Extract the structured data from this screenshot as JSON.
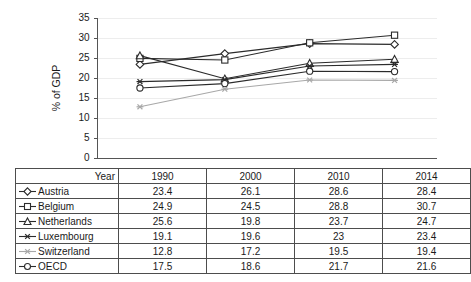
{
  "chart_data": {
    "type": "line",
    "title": "",
    "xlabel": "",
    "ylabel": "% of GDP",
    "categories": [
      "1990",
      "2000",
      "2010",
      "2014"
    ],
    "ylim": [
      0,
      35
    ],
    "yticks": [
      0,
      5,
      10,
      15,
      20,
      25,
      30,
      35
    ],
    "grid": true,
    "legend_position": "table",
    "series": [
      {
        "name": "Austria",
        "marker": "diamond",
        "color": "#2b2b2b",
        "values": [
          23.4,
          26.1,
          28.6,
          28.4
        ]
      },
      {
        "name": "Belgium",
        "marker": "square",
        "color": "#2b2b2b",
        "values": [
          24.9,
          24.5,
          28.8,
          30.7
        ]
      },
      {
        "name": "Netherlands",
        "marker": "triangle",
        "color": "#2b2b2b",
        "values": [
          25.6,
          19.8,
          23.7,
          24.7
        ]
      },
      {
        "name": "Luxembourg",
        "marker": "asterisk",
        "color": "#2b2b2b",
        "values": [
          19.1,
          19.6,
          23.0,
          23.4
        ]
      },
      {
        "name": "Switzerland",
        "marker": "asterisk",
        "color": "#a8a8a8",
        "values": [
          12.8,
          17.2,
          19.5,
          19.4
        ]
      },
      {
        "name": "OECD",
        "marker": "circle",
        "color": "#2b2b2b",
        "values": [
          17.5,
          18.6,
          21.7,
          21.6
        ]
      }
    ]
  },
  "table": {
    "header_label": "Year",
    "columns": [
      "1990",
      "2000",
      "2010",
      "2014"
    ],
    "rows": [
      {
        "name": "Austria",
        "values": [
          "23.4",
          "26.1",
          "28.6",
          "28.4"
        ]
      },
      {
        "name": "Belgium",
        "values": [
          "24.9",
          "24.5",
          "28.8",
          "30.7"
        ]
      },
      {
        "name": "Netherlands",
        "values": [
          "25.6",
          "19.8",
          "23.7",
          "24.7"
        ]
      },
      {
        "name": "Luxembourg",
        "values": [
          "19.1",
          "19.6",
          "23",
          "23.4"
        ]
      },
      {
        "name": "Switzerland",
        "values": [
          "12.8",
          "17.2",
          "19.5",
          "19.4"
        ]
      },
      {
        "name": "OECD",
        "values": [
          "17.5",
          "18.6",
          "21.7",
          "21.6"
        ]
      }
    ]
  },
  "colors": {
    "series_dark": "#2b2b2b",
    "series_light": "#a8a8a8",
    "grid": "#ededed",
    "axis": "#555555",
    "table_border": "#4d4d4d",
    "background": "#ffffff"
  }
}
